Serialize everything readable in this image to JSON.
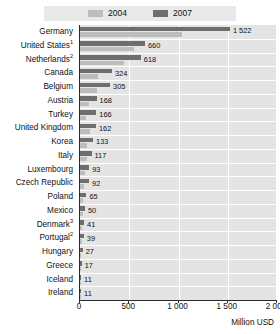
{
  "chart_data": {
    "type": "bar",
    "orientation": "horizontal",
    "title": "",
    "xlabel": "Million USD",
    "ylabel": "",
    "xlim": [
      0,
      2000
    ],
    "xticks": [
      0,
      500,
      1000,
      1500,
      2000
    ],
    "xtick_labels": [
      "0",
      "500",
      "1 000",
      "1 500",
      "2 000"
    ],
    "grid": true,
    "legend_position": "top",
    "categories": [
      "Germany",
      "United States",
      "Netherlands",
      "Canada",
      "Belgium",
      "Austria",
      "Turkey",
      "United Kingdom",
      "Korea",
      "Italy",
      "Luxembourg",
      "Czech Republic",
      "Poland",
      "Mexico",
      "Denmark",
      "Portugal",
      "Hungary",
      "Greece",
      "Iceland",
      "Ireland"
    ],
    "category_footnotes": [
      "",
      "1",
      "2",
      "",
      "",
      "",
      "",
      "",
      "",
      "",
      "",
      "",
      "",
      "",
      "3",
      "2",
      "",
      "",
      "",
      ""
    ],
    "series": [
      {
        "name": "2007",
        "color": "#6e6e6e",
        "values": [
          1522,
          660,
          618,
          324,
          305,
          168,
          166,
          162,
          133,
          117,
          93,
          92,
          65,
          50,
          41,
          39,
          27,
          17,
          11,
          11
        ],
        "value_labels": [
          "1 522",
          "660",
          "618",
          "324",
          "305",
          "168",
          "166",
          "162",
          "133",
          "117",
          "93",
          "92",
          "65",
          "50",
          "41",
          "39",
          "27",
          "17",
          "11",
          "11"
        ]
      },
      {
        "name": "2004",
        "color": "#bdbdbd",
        "values": [
          1035,
          545,
          450,
          185,
          170,
          95,
          60,
          105,
          70,
          68,
          52,
          40,
          30,
          26,
          22,
          20,
          14,
          9,
          6,
          6
        ],
        "value_labels": []
      }
    ]
  },
  "legend": {
    "items": [
      {
        "label": "2004",
        "color": "#bdbdbd"
      },
      {
        "label": "2007",
        "color": "#6e6e6e"
      }
    ]
  },
  "axis": {
    "unit_label": "Million USD"
  }
}
